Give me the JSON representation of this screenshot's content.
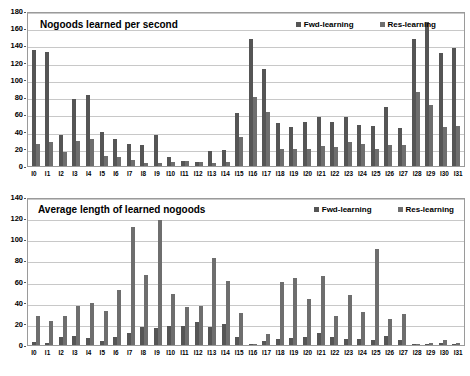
{
  "chart_data": [
    {
      "type": "bar",
      "title": "Nogoods learned per second",
      "xlabel": "",
      "ylabel": "",
      "ylim": [
        0,
        180
      ],
      "ytick_step": 20,
      "yticks": [
        0,
        20,
        40,
        60,
        80,
        100,
        120,
        140,
        160,
        180
      ],
      "grid": true,
      "legend_position": "top-right-inside",
      "categories": [
        "I0",
        "I1",
        "I2",
        "I3",
        "I4",
        "I5",
        "I6",
        "I7",
        "I8",
        "I9",
        "I10",
        "I11",
        "I12",
        "I13",
        "I14",
        "I15",
        "I16",
        "I17",
        "I18",
        "I19",
        "I20",
        "I21",
        "I22",
        "I23",
        "I24",
        "I25",
        "I26",
        "I27",
        "I28",
        "I29",
        "I30",
        "I31"
      ],
      "series": [
        {
          "name": "Fwd-learning",
          "color": "#555555",
          "values": [
            135,
            132,
            36,
            78,
            82,
            40,
            31,
            26,
            24,
            36,
            10,
            6,
            5,
            17,
            19,
            62,
            147,
            113,
            50,
            45,
            51,
            57,
            51,
            57,
            48,
            46,
            69,
            44,
            147,
            167,
            131,
            137
          ]
        },
        {
          "name": "Res-learning",
          "color": "#6e6e6e",
          "values": [
            25,
            28,
            16,
            29,
            31,
            12,
            10,
            7,
            4,
            4,
            5,
            6,
            5,
            4,
            5,
            34,
            80,
            63,
            20,
            20,
            20,
            23,
            22,
            28,
            25,
            20,
            24,
            24,
            86,
            71,
            45,
            47
          ]
        }
      ]
    },
    {
      "type": "bar",
      "title": "Average length of learned nogoods",
      "xlabel": "",
      "ylabel": "",
      "ylim": [
        0,
        140
      ],
      "ytick_step": 20,
      "yticks": [
        0,
        20,
        40,
        60,
        80,
        100,
        120,
        140
      ],
      "grid": true,
      "legend_position": "top-right-inside",
      "categories": [
        "I0",
        "I1",
        "I2",
        "I3",
        "I4",
        "I5",
        "I6",
        "I7",
        "I8",
        "I9",
        "I10",
        "I11",
        "I12",
        "I13",
        "I14",
        "I15",
        "I16",
        "I17",
        "I18",
        "I19",
        "I20",
        "I21",
        "I22",
        "I23",
        "I24",
        "I25",
        "I26",
        "I27",
        "I28",
        "I29",
        "I30",
        "I31"
      ],
      "series": [
        {
          "name": "Fwd-learning",
          "color": "#555555",
          "values": [
            3,
            2,
            8,
            9,
            7,
            4,
            8,
            11,
            17,
            16,
            18,
            18,
            22,
            17,
            20,
            8,
            1,
            4,
            6,
            7,
            8,
            11,
            8,
            6,
            6,
            5,
            9,
            5,
            1,
            1,
            2,
            1
          ]
        },
        {
          "name": "Res-learning",
          "color": "#6e6e6e",
          "values": [
            27,
            23,
            27,
            37,
            40,
            32,
            52,
            112,
            66,
            118,
            48,
            36,
            37,
            82,
            61,
            30,
            1,
            10,
            60,
            63,
            44,
            65,
            27,
            47,
            31,
            91,
            25,
            29,
            1,
            2,
            5,
            2
          ]
        }
      ]
    }
  ]
}
